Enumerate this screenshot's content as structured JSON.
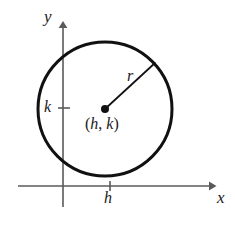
{
  "figure": {
    "type": "geometry-diagram",
    "canvas": {
      "width": 235,
      "height": 227,
      "background": "#ffffff"
    },
    "axes": {
      "x_axis": {
        "label": "x",
        "color": "#5a5a5a",
        "y_position": 186,
        "x_start": 18,
        "x_end": 215,
        "arrow": "right"
      },
      "y_axis": {
        "label": "y",
        "color": "#5a5a5a",
        "x_position": 63,
        "y_start": 22,
        "y_end": 207,
        "arrow": "up"
      },
      "ticks": [
        {
          "name": "h",
          "label": "h",
          "axis": "x",
          "position": 110
        },
        {
          "name": "k",
          "label": "k",
          "axis": "y",
          "position": 108
        }
      ]
    },
    "circle": {
      "center_x": 105,
      "center_y": 109,
      "radius": 67,
      "stroke": "#111111",
      "stroke_width": 3,
      "fill": "none"
    },
    "center_point": {
      "label": "(h, k)",
      "label_open_paren": "(",
      "label_h": "h",
      "label_comma": ", ",
      "label_k": "k",
      "label_close_paren": ")",
      "x": 105,
      "y": 109,
      "dot_radius": 4,
      "color": "#111111"
    },
    "radius_line": {
      "label": "r",
      "from_x": 105,
      "from_y": 109,
      "to_x": 155,
      "to_y": 63,
      "stroke": "#111111",
      "stroke_width": 1.6
    }
  }
}
